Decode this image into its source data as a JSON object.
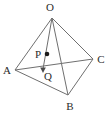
{
  "figure": {
    "name": "tetrahedron-oabc-with-points-p-q",
    "background_color": "#ffffff",
    "line_color": "#6f6f6f",
    "label_color": "#2b2b2b",
    "point_color": "#1a1a1a",
    "width": 111,
    "height": 113
  },
  "vertices": [
    {
      "id": "O",
      "label": "O",
      "x": 52,
      "y": 18,
      "label_x": 50,
      "label_y": 7
    },
    {
      "id": "A",
      "label": "A",
      "x": 15,
      "y": 70,
      "label_x": 7,
      "label_y": 70
    },
    {
      "id": "B",
      "label": "B",
      "x": 68,
      "y": 95,
      "label_x": 70,
      "label_y": 106
    },
    {
      "id": "C",
      "label": "C",
      "x": 93,
      "y": 59,
      "label_x": 101,
      "label_y": 59
    }
  ],
  "interior_points": [
    {
      "id": "P",
      "label": "P",
      "x": 47,
      "y": 54,
      "label_x": 38,
      "label_y": 54,
      "dot": true
    },
    {
      "id": "Q",
      "label": "Q",
      "x": 43,
      "y": 70,
      "label_x": 48,
      "label_y": 76,
      "dot": false
    }
  ],
  "edges": [
    {
      "id": "OA",
      "from": "O",
      "to": "A"
    },
    {
      "id": "OB",
      "from": "O",
      "to": "B"
    },
    {
      "id": "OC",
      "from": "O",
      "to": "C"
    },
    {
      "id": "AB",
      "from": "A",
      "to": "B"
    },
    {
      "id": "AC",
      "from": "A",
      "to": "C"
    },
    {
      "id": "BC",
      "from": "B",
      "to": "C"
    }
  ],
  "segments": [
    {
      "id": "OQ",
      "description": "segment from apex O through P down to Q",
      "from_x": 52,
      "from_y": 18,
      "to_x": 43,
      "to_y": 70
    }
  ],
  "arrow": {
    "id": "PQ-arrow",
    "description": "downward arrow ending at Q",
    "tip_x": 43,
    "tip_y": 72
  }
}
